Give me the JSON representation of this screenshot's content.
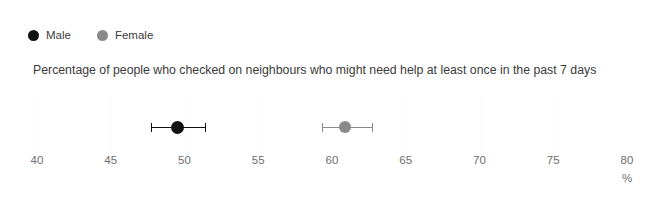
{
  "legend": {
    "position": "top-left",
    "items": [
      {
        "label": "Male",
        "color": "#111111",
        "icon": "circle-marker-icon"
      },
      {
        "label": "Female",
        "color": "#8a8a8a",
        "icon": "circle-marker-icon"
      }
    ]
  },
  "title": "Percentage of people who checked on neighbours who might need help at least once in the past 7 days",
  "axis": {
    "unit": "%",
    "ticks": [
      {
        "label": "40",
        "value": 40
      },
      {
        "label": "45",
        "value": 45
      },
      {
        "label": "50",
        "value": 50
      },
      {
        "label": "55",
        "value": 55
      },
      {
        "label": "60",
        "value": 60
      },
      {
        "label": "65",
        "value": 65
      },
      {
        "label": "70",
        "value": 70
      },
      {
        "label": "75",
        "value": 75
      },
      {
        "label": "80",
        "value": 80
      }
    ]
  },
  "chart_data": {
    "type": "scatter",
    "title": "Percentage of people who checked on neighbours who might need help at least once in the past 7 days",
    "xlabel": "%",
    "ylabel": "",
    "xlim": [
      40,
      80
    ],
    "grid": true,
    "legend_position": "top-left",
    "orientation": "horizontal",
    "error_bars": "horizontal",
    "series": [
      {
        "name": "Male",
        "color": "#111111",
        "value": 49.5,
        "ci_low": 47.7,
        "ci_high": 51.4
      },
      {
        "name": "Female",
        "color": "#8a8a8a",
        "value": 60.9,
        "ci_low": 59.3,
        "ci_high": 62.7
      }
    ]
  }
}
